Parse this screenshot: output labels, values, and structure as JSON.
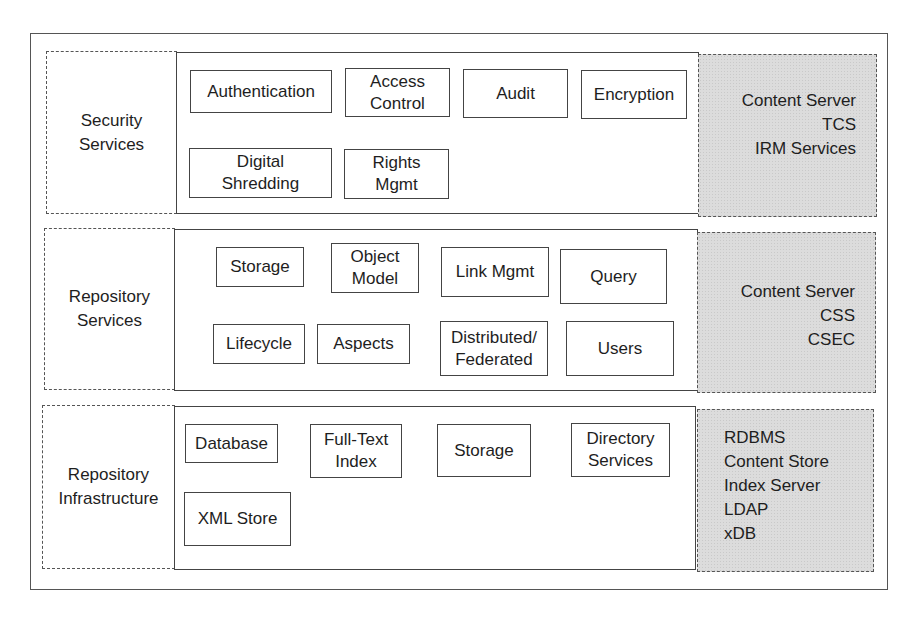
{
  "diagram": {
    "layers": [
      {
        "name": "Security Services",
        "label_lines": [
          "Security",
          "Services"
        ],
        "components": [
          {
            "lines": [
              "Authentication"
            ]
          },
          {
            "lines": [
              "Access",
              "Control"
            ]
          },
          {
            "lines": [
              "Audit"
            ]
          },
          {
            "lines": [
              "Encryption"
            ]
          },
          {
            "lines": [
              "Digital",
              "Shredding"
            ]
          },
          {
            "lines": [
              "Rights",
              "Mgmt"
            ]
          }
        ],
        "implementations": [
          "Content Server",
          "TCS",
          "IRM Services"
        ]
      },
      {
        "name": "Repository Services",
        "label_lines": [
          "Repository",
          "Services"
        ],
        "components": [
          {
            "lines": [
              "Storage"
            ]
          },
          {
            "lines": [
              "Object",
              "Model"
            ]
          },
          {
            "lines": [
              "Link Mgmt"
            ]
          },
          {
            "lines": [
              "Query"
            ]
          },
          {
            "lines": [
              "Lifecycle"
            ]
          },
          {
            "lines": [
              "Aspects"
            ]
          },
          {
            "lines": [
              "Distributed/",
              "Federated"
            ]
          },
          {
            "lines": [
              "Users"
            ]
          }
        ],
        "implementations": [
          "Content Server",
          "CSS",
          "CSEC"
        ]
      },
      {
        "name": "Repository Infrastructure",
        "label_lines": [
          "Repository",
          "Infrastructure"
        ],
        "components": [
          {
            "lines": [
              "Database"
            ]
          },
          {
            "lines": [
              "Full-Text",
              "Index"
            ]
          },
          {
            "lines": [
              "Storage"
            ]
          },
          {
            "lines": [
              "Directory",
              "Services"
            ]
          },
          {
            "lines": [
              "XML Store"
            ]
          }
        ],
        "implementations": [
          "RDBMS",
          "Content Store",
          "Index Server",
          "LDAP",
          "xDB"
        ]
      }
    ],
    "colors": {
      "line": "#444444",
      "implementation_fill": "#dcdcdc",
      "background": "#ffffff"
    }
  }
}
